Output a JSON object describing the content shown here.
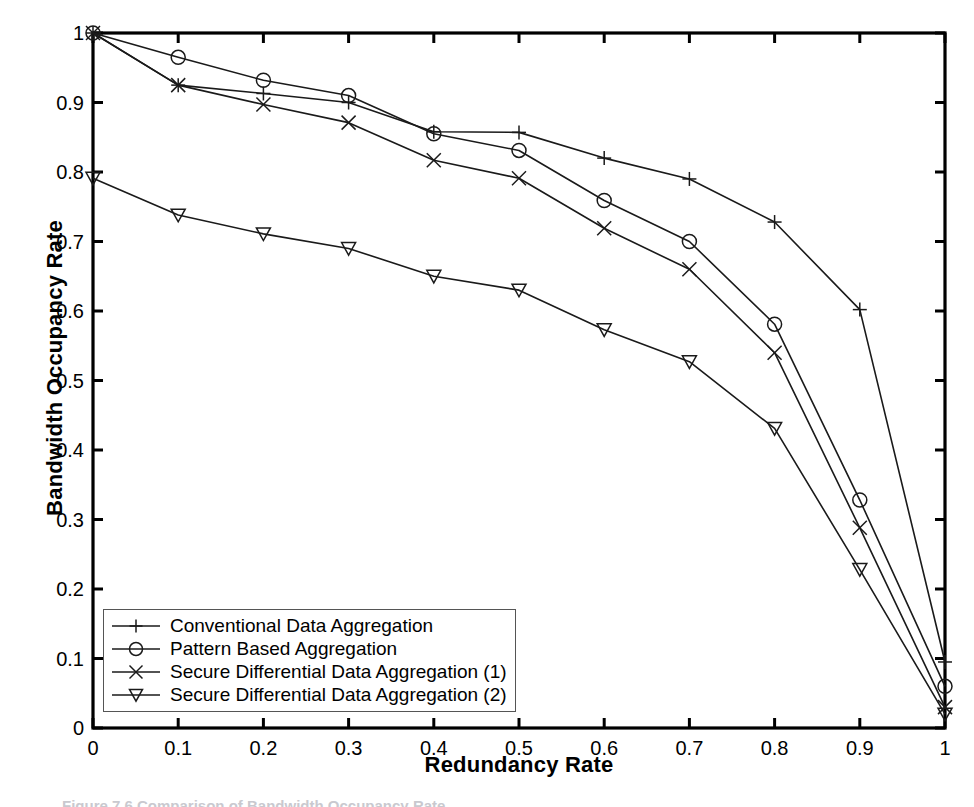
{
  "chart_data": {
    "type": "line",
    "title": "",
    "xlabel": "Redundancy Rate",
    "ylabel": "Bandwidth Occupancy Rate",
    "x": [
      0,
      0.1,
      0.2,
      0.3,
      0.4,
      0.5,
      0.6,
      0.7,
      0.8,
      0.9,
      1
    ],
    "xlim": [
      0,
      1
    ],
    "ylim": [
      0,
      1
    ],
    "xticks": [
      "0",
      "0.1",
      "0.2",
      "0.3",
      "0.4",
      "0.5",
      "0.6",
      "0.7",
      "0.8",
      "0.9",
      "1"
    ],
    "yticks": [
      "0",
      "0.1",
      "0.2",
      "0.3",
      "0.4",
      "0.5",
      "0.6",
      "0.7",
      "0.8",
      "0.9",
      "1"
    ],
    "grid": false,
    "legend_position": "lower-left",
    "series": [
      {
        "name": "Conventional Data Aggregation",
        "marker": "plus",
        "color": "#1a1a1a",
        "values": [
          1.0,
          0.925,
          0.913,
          0.9,
          0.858,
          0.857,
          0.82,
          0.79,
          0.728,
          0.602,
          0.095
        ]
      },
      {
        "name": "Pattern Based Aggregation",
        "marker": "circle",
        "color": "#1a1a1a",
        "values": [
          1.0,
          0.965,
          0.932,
          0.91,
          0.855,
          0.831,
          0.759,
          0.7,
          0.581,
          0.328,
          0.06
        ]
      },
      {
        "name": "Secure Differential Data Aggregation (1)",
        "marker": "cross",
        "color": "#1a1a1a",
        "values": [
          1.0,
          0.925,
          0.897,
          0.871,
          0.817,
          0.791,
          0.719,
          0.66,
          0.54,
          0.288,
          0.03
        ]
      },
      {
        "name": "Secure Differential Data Aggregation (2)",
        "marker": "triangle-down",
        "color": "#1a1a1a",
        "values": [
          0.791,
          0.738,
          0.711,
          0.69,
          0.65,
          0.63,
          0.573,
          0.527,
          0.431,
          0.228,
          0.02
        ]
      }
    ]
  },
  "caption": {
    "text": "Figure 7.6   Comparison of Bandwidth Occupancy Rate"
  }
}
